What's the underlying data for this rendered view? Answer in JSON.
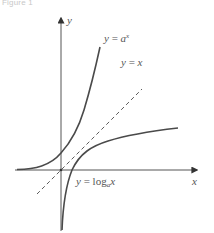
{
  "figure": {
    "caption": "Figure 1",
    "axes": {
      "x_label": "x",
      "y_label": "y"
    },
    "curves": [
      {
        "id": "exp",
        "label_lhs": "y",
        "label_eq": "=",
        "label_base": "a",
        "label_exp": "x",
        "style": "solid"
      },
      {
        "id": "identity",
        "label_lhs": "y",
        "label_eq": "=",
        "label_rhs": "x",
        "style": "dashed"
      },
      {
        "id": "log",
        "label_lhs": "y",
        "label_eq": "=",
        "label_fn": "log",
        "label_sub": "a",
        "label_arg": "x",
        "style": "solid"
      }
    ],
    "colors": {
      "axis": "#555555",
      "curve": "#4a4a4a",
      "label": "#555555"
    }
  }
}
